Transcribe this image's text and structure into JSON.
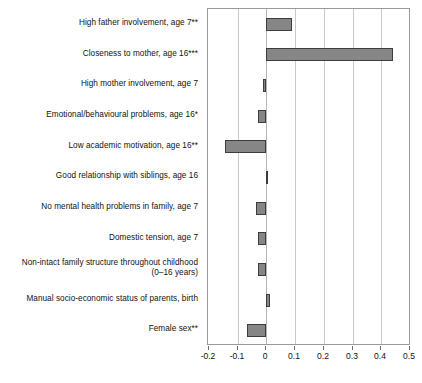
{
  "chart_data": {
    "type": "bar",
    "orientation": "horizontal",
    "title": "",
    "subtitle": "",
    "xlabel": "",
    "ylabel": "",
    "xlim": [
      -0.2,
      0.5
    ],
    "xticks": [
      -0.2,
      -0.1,
      0,
      0.1,
      0.2,
      0.3,
      0.4,
      0.5
    ],
    "xtick_labels": [
      "-0.2",
      "-0.1",
      "0",
      "0.1",
      "0.2",
      "0.3",
      "0.4",
      "0.5"
    ],
    "grid": true,
    "legend": null,
    "bar_color": "#868686",
    "bar_edge_color": "#3d3d3d",
    "categories": [
      "High father involvement, age 7**",
      "Closeness to mother, age 16***",
      "High mother involvement, age 7",
      "Emotional/behavioural problems, age 16*",
      "Low academic motivation, age 16**",
      "Good relationship with siblings, age 16",
      "No mental health problems in family, age 7",
      "Domestic tension, age 7",
      "Non-intact family structure throughout childhood\n(0–16 years)",
      "Manual socio-economic status of parents, birth",
      "Female sex**"
    ],
    "values": [
      0.09,
      0.44,
      -0.012,
      -0.028,
      -0.145,
      0.006,
      -0.038,
      -0.028,
      -0.03,
      0.014,
      -0.066
    ]
  }
}
